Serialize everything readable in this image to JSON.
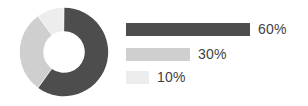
{
  "chart_data": {
    "type": "pie",
    "title": "",
    "subtitle": "",
    "xlabel": "",
    "ylabel": "",
    "variant": "donut",
    "grid": false,
    "legend_position": "right",
    "start_angle_deg": 0,
    "direction": "clockwise",
    "inner_radius_ratio": 0.47,
    "categories": [
      "60%",
      "30%",
      "10%"
    ],
    "values": [
      60,
      30,
      10
    ],
    "value_unit": "%",
    "colors": [
      "#4d4d4d",
      "#cfcfcf",
      "#ededed"
    ],
    "segments": [
      {
        "label": "60%",
        "value": 60,
        "color": "#4d4d4d"
      },
      {
        "label": "30%",
        "value": 30,
        "color": "#cfcfcf"
      },
      {
        "label": "10%",
        "value": 10,
        "color": "#ededed"
      }
    ],
    "legend": [
      {
        "label": "60%",
        "value": 60,
        "color": "#4d4d4d",
        "bar_width_px": 124
      },
      {
        "label": "30%",
        "value": 30,
        "color": "#cfcfcf",
        "bar_width_px": 64
      },
      {
        "label": "10%",
        "value": 10,
        "color": "#ededed",
        "bar_width_px": 23
      }
    ]
  },
  "colors": {
    "background": "#ffffff",
    "text": "#3f3f3f",
    "series_dark": "#4d4d4d",
    "series_medium": "#cfcfcf",
    "series_light": "#ededed"
  }
}
